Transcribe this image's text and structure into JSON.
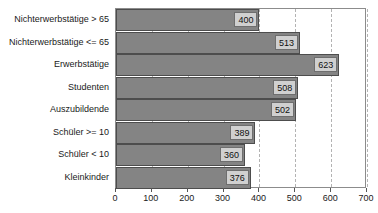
{
  "chart_data": {
    "type": "bar",
    "orientation": "horizontal",
    "title": "",
    "subtitle": "",
    "xlabel": "",
    "ylabel": "",
    "xlim": [
      0,
      700
    ],
    "xticks": [
      0,
      100,
      200,
      300,
      400,
      500,
      600,
      700
    ],
    "xtick_labels": [
      "0",
      "100",
      "200",
      "300",
      "400",
      "500",
      "600",
      "700"
    ],
    "grid": "vertical-dashed",
    "legend": "none",
    "categories": [
      "Nichterwerbstätige > 65",
      "Nichterwerbstätige <= 65",
      "Erwerbstätige",
      "Studenten",
      "Auszubildende",
      "Schüler >= 10",
      "Schüler < 10",
      "Kleinkinder"
    ],
    "values": [
      400,
      513,
      623,
      508,
      502,
      389,
      360,
      376
    ],
    "value_labels": [
      "400",
      "513",
      "623",
      "508",
      "502",
      "389",
      "360",
      "376"
    ],
    "colors": {
      "bar_fill": "#848484",
      "bar_border": "#4d4d4d",
      "label_box_fill": "#d0d0d0",
      "label_box_border": "#6e6e6e",
      "gridline": "#b3b3b3",
      "plot_border": "#8c8c8c",
      "text": "#1a1a1a",
      "background": "#ffffff"
    }
  }
}
